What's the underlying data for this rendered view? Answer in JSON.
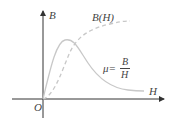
{
  "diagram": {
    "axes": {
      "y_label": "B",
      "x_label": "H",
      "origin": "O"
    },
    "curves": [
      {
        "name": "B(H)",
        "style": "dashed",
        "label": "B(H)"
      },
      {
        "name": "mu",
        "style": "solid",
        "label_left": "μ=",
        "label_num": "B",
        "label_den": "H"
      }
    ],
    "colors": {
      "axis": "#333333",
      "curve": "#bbbbbb",
      "text": "#444444"
    }
  }
}
